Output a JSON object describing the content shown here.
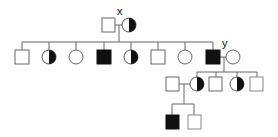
{
  "diagram": {
    "type": "pedigree",
    "labels": {
      "x": "x",
      "y": "y"
    },
    "colors": {
      "line": "#666666",
      "affected": "#111111",
      "background": "#ffffff"
    },
    "legend_semantics": {
      "square": "male",
      "circle": "female",
      "filled": "affected",
      "half-filled": "carrier"
    },
    "generations": [
      {
        "id": "I",
        "individuals": [
          {
            "id": "I-1",
            "sex": "male",
            "status": "unaffected"
          },
          {
            "id": "I-2",
            "sex": "female",
            "status": "carrier",
            "label": "x"
          }
        ]
      },
      {
        "id": "II",
        "individuals": [
          {
            "id": "II-1",
            "sex": "male",
            "status": "unaffected"
          },
          {
            "id": "II-2",
            "sex": "female",
            "status": "carrier"
          },
          {
            "id": "II-3",
            "sex": "female",
            "status": "unaffected"
          },
          {
            "id": "II-4",
            "sex": "male",
            "status": "affected"
          },
          {
            "id": "II-5",
            "sex": "female",
            "status": "carrier"
          },
          {
            "id": "II-6",
            "sex": "male",
            "status": "unaffected"
          },
          {
            "id": "II-7",
            "sex": "female",
            "status": "unaffected"
          },
          {
            "id": "II-8",
            "sex": "male",
            "status": "affected",
            "label": "y"
          },
          {
            "id": "II-9",
            "sex": "female",
            "status": "unaffected",
            "note": "spouse of II-8"
          }
        ]
      },
      {
        "id": "III",
        "individuals": [
          {
            "id": "III-0",
            "sex": "male",
            "status": "unaffected",
            "note": "spouse of III-1"
          },
          {
            "id": "III-1",
            "sex": "female",
            "status": "carrier"
          },
          {
            "id": "III-2",
            "sex": "male",
            "status": "unaffected"
          },
          {
            "id": "III-3",
            "sex": "female",
            "status": "carrier"
          },
          {
            "id": "III-4",
            "sex": "male",
            "status": "unaffected"
          }
        ]
      },
      {
        "id": "IV",
        "individuals": [
          {
            "id": "IV-1",
            "sex": "male",
            "status": "affected"
          },
          {
            "id": "IV-2",
            "sex": "male",
            "status": "unaffected"
          }
        ]
      }
    ]
  }
}
